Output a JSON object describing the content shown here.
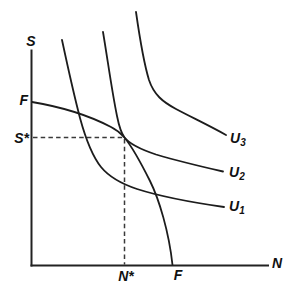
{
  "figure": {
    "background_color": "#ffffff",
    "ink_color": "#1c1c1c",
    "dash_color": "#3a3a3a",
    "axes": {
      "y_axis_label": "S",
      "x_axis_label": "N",
      "y_axis_path": "M 31.5 50.5 L 31.5 265.5",
      "x_axis_path": "M 31.5 265.5 L 268 265.5"
    },
    "intercepts": {
      "frontier_y_intercept_label": "F",
      "frontier_x_intercept_label": "F"
    },
    "optimum": {
      "s_star_label": "S*",
      "n_star_label": "N*",
      "dashed_horizontal_path": "M 33 137.5 L 124.5 137.5",
      "dashed_vertical_path": "M 124.5 139 L 124.5 264.5"
    },
    "curves": {
      "frontier": {
        "path": "M 32 102 C 62 107, 90 116, 111 127 C 117 130, 121 133.5, 124.5 137.5 C 131 145.5, 141 163, 150 181 C 159 199, 169 232, 172.5 265"
      },
      "u1": {
        "label_main": "U",
        "label_sub": "1",
        "path": "M 62 40 C 68 68, 74 95, 80 118 C 86 140, 93 157, 101 167 C 110 178, 122 184, 137 189 C 162 197, 196 203, 224 207"
      },
      "u2": {
        "label_main": "U",
        "label_sub": "2",
        "path": "M 103 32 C 108 62, 112 92, 117 116 C 119 126, 121.5 133.5, 124.5 137.5 C 130 144.5, 141 149.5, 156 154.5 C 178 161, 201 166.5, 223 171.5"
      },
      "u3": {
        "label_main": "U",
        "label_sub": "3",
        "path": "M 136 12 C 140 40, 143.5 62, 149 80 C 154 95, 163 102, 176 109 C 193 118, 210 126, 226 135"
      }
    }
  }
}
